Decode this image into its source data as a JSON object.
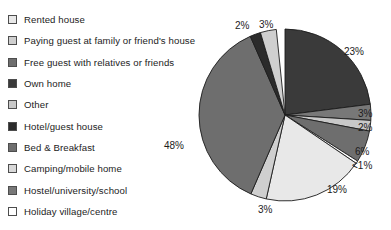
{
  "chart_data": {
    "type": "pie",
    "title": "",
    "xlabel": "",
    "ylabel": "",
    "legend_position": "left",
    "grid": false,
    "categories": [
      "Rented house",
      "Paying guest at family or friend's house",
      "Free guest with relatives or friends",
      "Own home",
      "Other",
      "Hotel/guest house",
      "Bed & Breakfast",
      "Camping/mobile home",
      "Hostel/university/school",
      "Holiday village/centre"
    ],
    "values": [
      48,
      23,
      19,
      6,
      3,
      3,
      3,
      2,
      2,
      0.5
    ],
    "slices": [
      {
        "label": "Own home",
        "value": 23,
        "display": "23%",
        "color": "#3a3a3a",
        "start_deg": 0,
        "end_deg": 82.8
      },
      {
        "label": "Hostel/university/school",
        "value": 3,
        "display": "3%",
        "color": "#787878",
        "start_deg": 82.8,
        "end_deg": 93.6
      },
      {
        "label": "Other",
        "value": 2,
        "display": "2%",
        "color": "#c8c8c8",
        "start_deg": 93.6,
        "end_deg": 100.8
      },
      {
        "label": "Bed & Breakfast",
        "value": 6,
        "display": "6%",
        "color": "#6e6e6e",
        "start_deg": 100.8,
        "end_deg": 122.4
      },
      {
        "label": "Holiday village/centre",
        "value": 0.5,
        "display": "<1%",
        "color": "#ffffff",
        "start_deg": 122.4,
        "end_deg": 124.2
      },
      {
        "label": "Rented house",
        "value": 19,
        "display": "19%",
        "color": "#e8e8e8",
        "start_deg": 124.2,
        "end_deg": 192.6
      },
      {
        "label": "Camping/mobile home",
        "value": 3,
        "display": "3%",
        "color": "#cfcfcf",
        "start_deg": 192.6,
        "end_deg": 203.4
      },
      {
        "label": "Free guest with relatives or friends",
        "value": 48,
        "display": "48%",
        "color": "#6e6e6e",
        "start_deg": 203.4,
        "end_deg": 336.2
      },
      {
        "label": "Hotel/guest house",
        "value": 2,
        "display": "2%",
        "color": "#2b2b2b",
        "start_deg": 336.2,
        "end_deg": 343.4
      },
      {
        "label": "Paying guest at family or friend's house",
        "value": 3,
        "display": "3%",
        "color": "#cfcfcf",
        "start_deg": 343.4,
        "end_deg": 354.2
      }
    ],
    "annotations": [
      "2%",
      "3%",
      "23%",
      "3%",
      "2%",
      "6%",
      "<1%",
      "19%",
      "3%",
      "48%"
    ]
  },
  "legend": {
    "items": [
      {
        "label": "Rented house",
        "color": "#e8e8e8"
      },
      {
        "label": "Paying guest at family or friend's house",
        "color": "#cfcfcf"
      },
      {
        "label": "Free guest with relatives or friends",
        "color": "#6e6e6e"
      },
      {
        "label": "Own home",
        "color": "#3a3a3a"
      },
      {
        "label": "Other",
        "color": "#c8c8c8"
      },
      {
        "label": "Hotel/guest house",
        "color": "#2b2b2b"
      },
      {
        "label": "Bed & Breakfast",
        "color": "#6e6e6e"
      },
      {
        "label": "Camping/mobile home",
        "color": "#d8d8d8"
      },
      {
        "label": "Hostel/university/school",
        "color": "#787878"
      },
      {
        "label": "Holiday village/centre",
        "color": "#ffffff"
      }
    ]
  },
  "pie_labels": [
    {
      "text": "2%",
      "left": 39,
      "top": 20
    },
    {
      "text": "3%",
      "left": 63,
      "top": 19
    },
    {
      "text": "23%",
      "left": 148,
      "top": 46
    },
    {
      "text": "3%",
      "left": 162,
      "top": 108
    },
    {
      "text": "2%",
      "left": 162,
      "top": 122
    },
    {
      "text": "6%",
      "left": 159,
      "top": 146
    },
    {
      "text": "<1%",
      "left": 156,
      "top": 160
    },
    {
      "text": "19%",
      "left": 131,
      "top": 184
    },
    {
      "text": "3%",
      "left": 62,
      "top": 204
    },
    {
      "text": "48%",
      "left": -32,
      "top": 140
    }
  ]
}
